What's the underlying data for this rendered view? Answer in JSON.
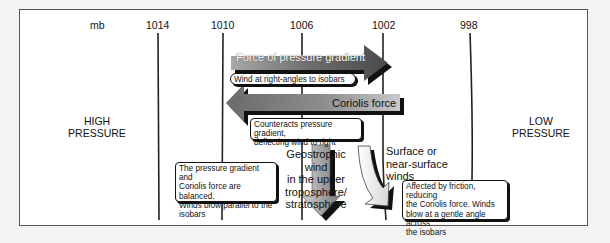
{
  "axis": {
    "unit": "mb",
    "isobars": [
      {
        "label": "1014"
      },
      {
        "label": "1010"
      },
      {
        "label": "1006"
      },
      {
        "label": "1002"
      },
      {
        "label": "998"
      }
    ]
  },
  "regions": {
    "high": {
      "line1": "HIGH",
      "line2": "PRESSURE"
    },
    "low": {
      "line1": "LOW",
      "line2": "PRESSURE"
    }
  },
  "forces": {
    "pressure_gradient": {
      "label": "Force of pressure gradient",
      "note": "Wind at right-angles to isobars",
      "direction": "right"
    },
    "coriolis": {
      "label": "Coriolis force",
      "note_line1": "Counteracts pressure gradient,",
      "note_line2": "deflecting wind to right",
      "direction": "left"
    }
  },
  "winds": {
    "geostrophic": {
      "label_lines": [
        "Geostrophic wind",
        "in the upper",
        "troposphere/",
        "stratosphere"
      ],
      "note_lines": [
        "The pressure gradient and",
        "Coriolis force are balanced.",
        "Winds blow parallel to the",
        "isobars"
      ]
    },
    "surface": {
      "label_lines": [
        "Surface or",
        "near-surface",
        "winds"
      ],
      "note_lines": [
        "Affected by friction, reducing",
        "the Coriolis force. Winds",
        "blow at a gentle angle across",
        "the isobars"
      ]
    }
  },
  "colors": {
    "isobar": "#222222",
    "arrow_dark": "#5a5a5a",
    "arrow_light": "#b5b5b5",
    "frame_border": "#555555"
  }
}
